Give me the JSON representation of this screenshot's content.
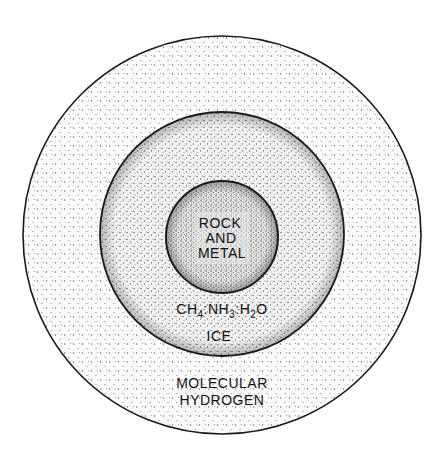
{
  "diagram": {
    "type": "concentric-layers",
    "layers": [
      {
        "id": "outer",
        "label_lines": [
          "MOLECULAR",
          "HYDROGEN"
        ],
        "fill": "#f7f7f7",
        "stipple": "sparse"
      },
      {
        "id": "middle",
        "label_lines": [
          "CH4·NH3·H2O",
          "ICE"
        ],
        "formula": {
          "parts": [
            "CH",
            "4",
            ":NH",
            "3",
            ":H",
            "2",
            "O"
          ]
        },
        "label_line2": "ICE",
        "fill": "#eeeeee",
        "stipple": "medium"
      },
      {
        "id": "core",
        "label_lines": [
          "ROCK",
          "AND",
          "METAL"
        ],
        "fill": "#dcdcdc",
        "stipple": "dense"
      }
    ]
  },
  "labels": {
    "core_1": "ROCK",
    "core_2": "AND",
    "core_3": "METAL",
    "ice_ch": "CH",
    "ice_4": "4",
    "ice_nh": ":NH",
    "ice_3": "3",
    "ice_h": ":H",
    "ice_2": "2",
    "ice_o": "O",
    "ice_word": "ICE",
    "outer_1": "MOLECULAR",
    "outer_2": "HYDROGEN"
  },
  "colors": {
    "stroke": "#1a1a1a",
    "dot": "#555555",
    "background": "#ffffff"
  }
}
